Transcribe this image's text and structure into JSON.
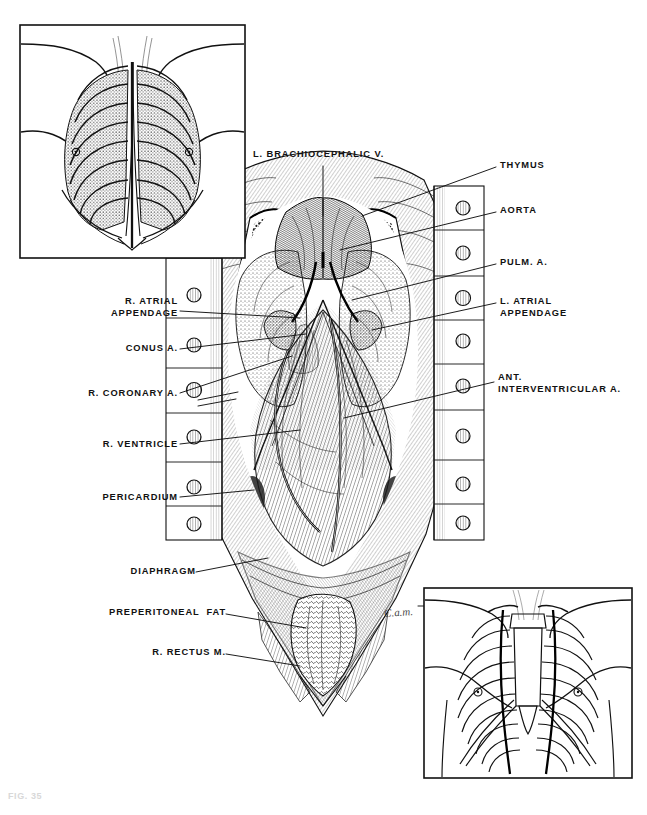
{
  "figure": {
    "caption": "FIG. 35",
    "artist_signature": "C.a.m.",
    "background_color": "#ffffff",
    "ink_color": "#111111"
  },
  "labels_left": [
    {
      "id": "r-atrial-appendage",
      "text": "R. ATRIAL\nAPPENDAGE",
      "x": 178,
      "y": 297
    },
    {
      "id": "conus-a",
      "text": "CONUS A.",
      "x": 178,
      "y": 345
    },
    {
      "id": "r-coronary-a",
      "text": "R. CORONARY A.",
      "x": 178,
      "y": 390
    },
    {
      "id": "r-ventricle",
      "text": "R. VENTRICLE",
      "x": 178,
      "y": 441
    },
    {
      "id": "pericardium",
      "text": "PERICARDIUM",
      "x": 178,
      "y": 494
    },
    {
      "id": "diaphragm",
      "text": "DIAPHRAGM",
      "x": 190,
      "y": 570
    },
    {
      "id": "preperitoneal-fat",
      "text": "PREPERITONEAL  FAT",
      "x": 218,
      "y": 611
    },
    {
      "id": "r-rectus-m",
      "text": "R. RECTUS M.",
      "x": 218,
      "y": 651
    }
  ],
  "labels_right": [
    {
      "id": "thymus",
      "text": "THYMUS",
      "x": 499,
      "y": 164
    },
    {
      "id": "aorta",
      "text": "AORTA",
      "x": 499,
      "y": 209
    },
    {
      "id": "pulm-a",
      "text": "PULM. A.",
      "x": 499,
      "y": 261
    },
    {
      "id": "l-atrial-appendage",
      "text": "L. ATRIAL\nAPPENDAGE",
      "x": 499,
      "y": 300
    },
    {
      "id": "ant-interventricular-a",
      "text": "ANT.\nINTERVENTRICULAR A.",
      "x": 497,
      "y": 376
    }
  ],
  "labels_top": [
    {
      "id": "l-brachiocephalic-v",
      "text": "L. BRACHIOCEPHALIC V.",
      "x": 253,
      "y": 155
    }
  ],
  "insets": [
    {
      "id": "inset-upper-left",
      "description": "anterior thorax with ribs, sternum and midline sternotomy incision",
      "x": 20,
      "y": 25,
      "width": 225,
      "height": 233
    },
    {
      "id": "inset-lower-right",
      "description": "anterior rib cage outline with internal thoracic arteries marked",
      "x": 424,
      "y": 588,
      "width": 208,
      "height": 190
    }
  ],
  "retractor": {
    "left_bar": {
      "x": 166,
      "y": 258,
      "width": 56,
      "height": 282,
      "screw_count": 6
    },
    "right_bar": {
      "x": 434,
      "y": 186,
      "width": 50,
      "height": 354,
      "screw_count": 8
    },
    "screw_label": "retractor-blade-screw"
  },
  "structures": [
    "thymus",
    "left brachiocephalic vein",
    "aorta",
    "pulmonary artery",
    "right atrial appendage",
    "left atrial appendage",
    "conus arteriosus",
    "right coronary artery",
    "anterior interventricular artery",
    "right ventricle",
    "pericardium",
    "diaphragm",
    "preperitoneal fat",
    "right rectus muscle"
  ]
}
